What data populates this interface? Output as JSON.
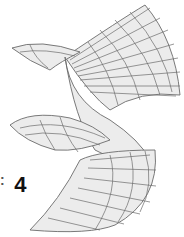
{
  "figure": {
    "type": "wireframe-surface",
    "label_prefix": ":",
    "label_value": "4",
    "colors": {
      "mesh_line": "#6b6b6b",
      "surface_fill": "#ececec",
      "label": "#111111"
    }
  }
}
